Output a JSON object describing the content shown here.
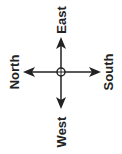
{
  "compass": {
    "labels": {
      "top": "East",
      "left": "North",
      "right": "South",
      "bottom": "West"
    },
    "colors": {
      "stroke": "#222222",
      "background": "#ffffff"
    }
  }
}
